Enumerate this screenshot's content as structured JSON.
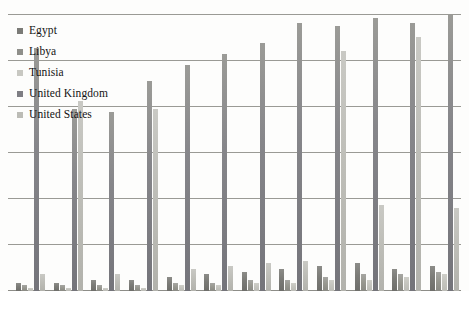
{
  "chart_data": {
    "type": "bar",
    "title": "",
    "subtitle": "",
    "xlabel": "",
    "ylabel": "",
    "grid": true,
    "legend_position": "top-left",
    "ylim": [
      0,
      100
    ],
    "gridline_count": 7,
    "categories": [
      "1",
      "2",
      "3",
      "4",
      "5",
      "6",
      "7",
      "8",
      "9",
      "10",
      "11",
      "12"
    ],
    "series": [
      {
        "name": "Egypt",
        "color": "#7b7b77",
        "values": [
          0.8,
          1.5,
          1.4,
          2.6,
          2.4,
          2.8,
          3.2,
          3.4,
          3.8,
          4.8,
          3.2,
          3.4
        ]
      },
      {
        "name": "Libya",
        "color": "#8f8f8a",
        "values": [
          0.5,
          0.8,
          0.9,
          1.1,
          1.2,
          1.5,
          1.8,
          1.9,
          2.0,
          2.2,
          2.4,
          2.6
        ]
      },
      {
        "name": "Tunisia",
        "color": "#c8c8c2",
        "values": [
          0.4,
          0.6,
          0.7,
          0.9,
          1.0,
          1.2,
          1.4,
          1.5,
          1.7,
          1.8,
          2.0,
          2.2
        ]
      },
      {
        "name": "United Kingdom",
        "color": "#7e7e84",
        "values": [
          40.5,
          58.0,
          57.0,
          68.5,
          76.0,
          81.0,
          86.5,
          95.0,
          94.5,
          99.5,
          95.5,
          103.0
        ]
      },
      {
        "name": "United States",
        "color": "#bcbcb6",
        "values": [
          2.0,
          60.5,
          6.0,
          61.0,
          6.5,
          7.5,
          8.5,
          9.0,
          80.0,
          13.5,
          85.5,
          10.5
        ]
      }
    ],
    "bar_heights_pct": [
      [
        3,
        2,
        1,
        88,
        6
      ],
      [
        3,
        2,
        1,
        66,
        69
      ],
      [
        4,
        2,
        1,
        65,
        6
      ],
      [
        4,
        2,
        1,
        76,
        66
      ],
      [
        5,
        3,
        2,
        82,
        8
      ],
      [
        6,
        3,
        2,
        86,
        9
      ],
      [
        7,
        4,
        3,
        90,
        10
      ],
      [
        8,
        4,
        3,
        97,
        11
      ],
      [
        9,
        5,
        4,
        96,
        87
      ],
      [
        10,
        6,
        4,
        99,
        31
      ],
      [
        8,
        6,
        5,
        97,
        92
      ],
      [
        9,
        7,
        6,
        100,
        30
      ]
    ]
  },
  "legend": {
    "items": [
      {
        "label": "Egypt",
        "swatch": "s0"
      },
      {
        "label": "Libya",
        "swatch": "s1"
      },
      {
        "label": "Tunisia",
        "swatch": "s2"
      },
      {
        "label": "United Kingdom",
        "swatch": "s3"
      },
      {
        "label": "United States",
        "swatch": "s4"
      }
    ]
  },
  "axis": {
    "gridline_ys": [
      0,
      46,
      92,
      138,
      184,
      230,
      276
    ]
  }
}
